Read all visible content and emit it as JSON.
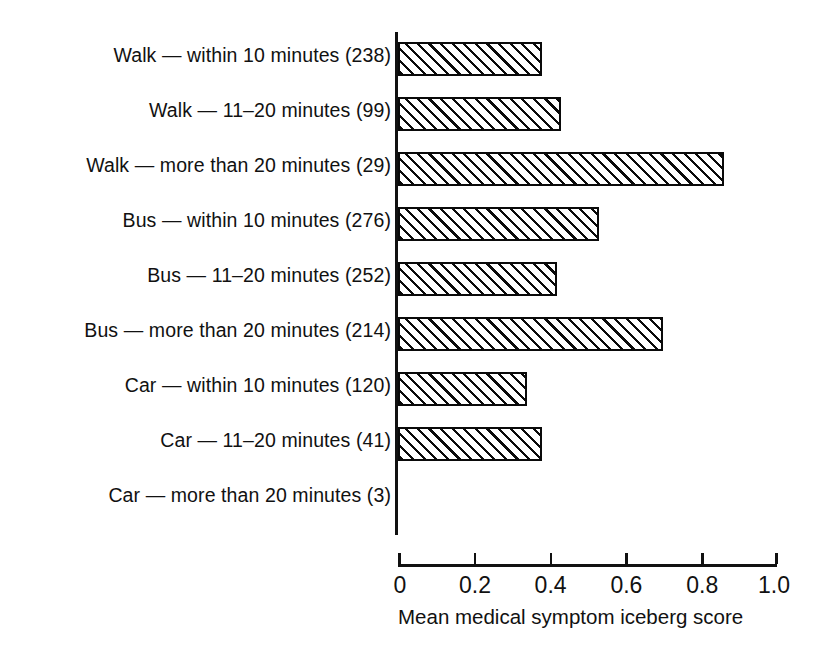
{
  "chart_data": {
    "type": "bar",
    "orientation": "horizontal",
    "title": "",
    "xlabel": "Mean medical symptom iceberg score",
    "ylabel": "",
    "xlim": [
      0,
      1.0
    ],
    "xticks": [
      0,
      0.2,
      0.4,
      0.6,
      0.8,
      1.0
    ],
    "xtick_labels": [
      "0",
      "0.2",
      "0.4",
      "0.6",
      "0.8",
      "1.0"
    ],
    "grid": false,
    "legend": false,
    "categories": [
      "Walk — within 10 minutes (238)",
      "Walk — 11–20 minutes (99)",
      "Walk — more than 20 minutes (29)",
      "Bus — within 10 minutes (276)",
      "Bus — 11–20 minutes (252)",
      "Bus — more than 20 minutes (214)",
      "Car — within 10 minutes (120)",
      "Car — 11–20 minutes (41)",
      "Car — more than 20 minutes (3)"
    ],
    "counts": [
      238,
      99,
      29,
      276,
      252,
      214,
      120,
      41,
      3
    ],
    "values": [
      0.38,
      0.43,
      0.86,
      0.53,
      0.42,
      0.7,
      0.34,
      0.38,
      0.0
    ],
    "bar_style": {
      "fill": "diagonal-hatch",
      "hatch_color": "#0a0a0a",
      "background": "#ffffff",
      "border_color": "#0a0a0a"
    }
  },
  "colors": {
    "ink": "#111111",
    "page": "#ffffff"
  }
}
